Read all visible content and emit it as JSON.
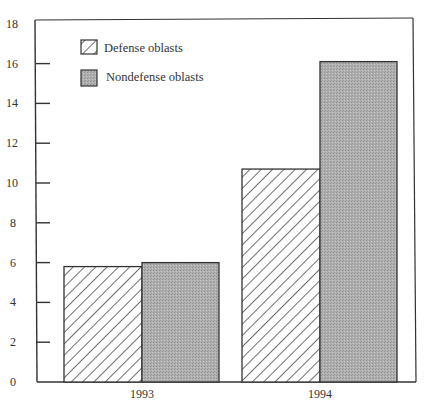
{
  "chart_data": {
    "type": "bar",
    "title": "",
    "xlabel": "",
    "ylabel": "",
    "categories": [
      "1993",
      "1994"
    ],
    "series": [
      {
        "name": "Defense oblasts",
        "values": [
          5.8,
          10.7
        ],
        "fill": "hatched"
      },
      {
        "name": "Nondefense oblasts",
        "values": [
          6.0,
          16.1
        ],
        "fill": "stippled-gray"
      }
    ],
    "ylim": [
      0,
      18
    ],
    "yticks": [
      0,
      2,
      4,
      6,
      8,
      10,
      12,
      14,
      16,
      18
    ],
    "grid": false,
    "legend_position": "upper-left-inside"
  },
  "colors": {
    "axis": "#333333",
    "hatch_line": "#333333",
    "gray_fill": "#a9a9a9",
    "bar_border": "#333333"
  },
  "legend": {
    "items": [
      {
        "label": "Defense oblasts",
        "swatch": "hatched"
      },
      {
        "label": "Nondefense oblasts",
        "swatch": "gray"
      }
    ]
  }
}
